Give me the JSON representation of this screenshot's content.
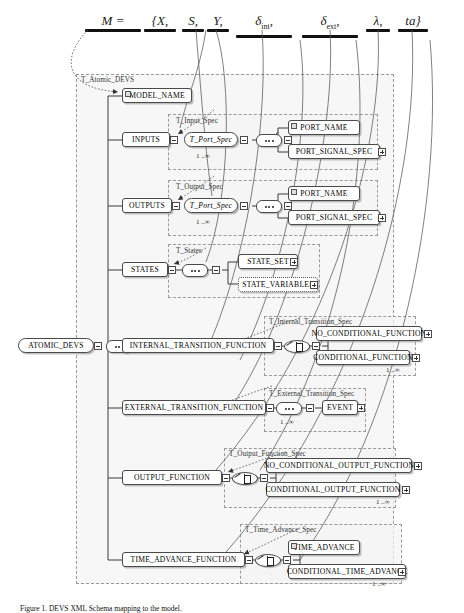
{
  "figure": {
    "caption": "Figure 1.  DEVS XML Schema mapping to the model."
  },
  "formula": {
    "lhs": "M =",
    "terms": [
      {
        "text": "{X,",
        "id": "term-X"
      },
      {
        "text": "S,",
        "id": "term-S"
      },
      {
        "text": "Y,",
        "id": "term-Y"
      },
      {
        "text": "δint,",
        "id": "term-delta-int",
        "base": "δ",
        "sub": "int",
        "tail": ","
      },
      {
        "text": "δext,",
        "id": "term-delta-ext",
        "base": "δ",
        "sub": "ext",
        "tail": ","
      },
      {
        "text": "λ,",
        "id": "term-lambda"
      },
      {
        "text": "ta}",
        "id": "term-ta"
      }
    ]
  },
  "root_element": "ATOMIC_DEVS",
  "panels": {
    "atomic_devs": "T_Atomic_DEVS",
    "input_spec": "T_Input_Spec",
    "output_spec": "T_Output_Spec",
    "states": "T_States",
    "internal_transition": "T_Internal_Transition_Spec",
    "external_transition": "T_External_Transition_Spec",
    "output_function": "T_Output_Function_Spec",
    "time_advance": "T_Time_Advance_Spec"
  },
  "nodes": {
    "model_name": "MODEL_NAME",
    "inputs": "INPUTS",
    "input_port_spec": "T_Port_Spec",
    "input_port_name": "PORT_NAME",
    "input_port_signal_spec": "PORT_SIGNAL_SPEC",
    "outputs": "OUTPUTS",
    "output_port_spec": "T_Port_Spec",
    "output_port_name": "PORT_NAME",
    "output_port_signal_spec": "PORT_SIGNAL_SPEC",
    "states": "STATES",
    "state_set": "STATE_SET",
    "state_variables": "STATE_VARIABLES",
    "internal_transition_function": "INTERNAL_TRANSITION_FUNCTION",
    "no_conditional_function": "NO_CONDITIONAL_FUNCTION",
    "conditional_function": "CONDITIONAL_FUNCTION",
    "external_transition_function": "EXTERNAL_TRANSITION_FUNCTION",
    "event": "EVENT",
    "output_function": "OUTPUT_FUNCTION",
    "no_conditional_output_function": "NO_CONDITIONAL_OUTPUT_FUNCTION",
    "conditional_output_function": "CONDITIONAL_OUTPUT_FUNCTION",
    "time_advance_function": "TIME_ADVANCE_FUNCTION",
    "time_advance": "TIME_ADVANCE",
    "conditional_time_advance": "CONDITIONAL_TIME_ADVANCE"
  },
  "cardinality": {
    "input_port": "1 ..∞",
    "output_port": "1 ..∞",
    "internal_conditional": "1 ..∞",
    "external_event": "1 ..∞",
    "output_conditional": "1 ..∞",
    "time_advance_conditional": "1 ..∞"
  },
  "colors": {
    "panel_fill": "#f4f4f4",
    "panel_border": "#9a9a9a",
    "node_border": "#4a4a4a",
    "node_fill": "#ffffff",
    "connector_line": "#3a3a3a",
    "mapping_curve": "#555555",
    "bar": "#111111"
  }
}
